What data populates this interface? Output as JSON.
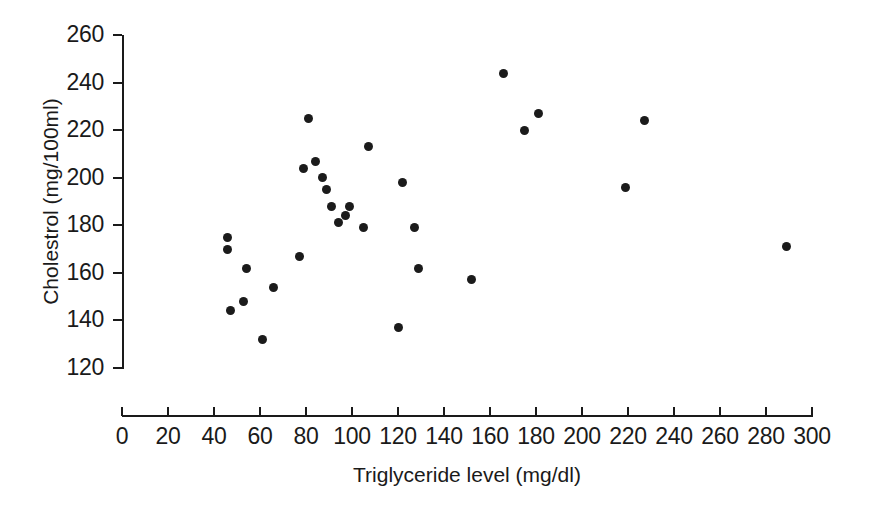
{
  "chart_data": {
    "type": "scatter",
    "title": "",
    "xlabel": "Triglyceride level (mg/dl)",
    "ylabel": "Cholestrol (mg/100ml)",
    "xlim": [
      0,
      300
    ],
    "ylim": [
      120,
      260
    ],
    "xticks": [
      0,
      20,
      40,
      60,
      80,
      100,
      120,
      140,
      160,
      180,
      200,
      220,
      240,
      260,
      280,
      300
    ],
    "yticks": [
      120,
      140,
      160,
      180,
      200,
      220,
      240,
      260
    ],
    "grid": false,
    "legend": null,
    "marker": {
      "shape": "circle",
      "color": "#1b1b1b",
      "size": 9
    },
    "points": [
      {
        "x": 46,
        "y": 175
      },
      {
        "x": 46,
        "y": 170
      },
      {
        "x": 47,
        "y": 144
      },
      {
        "x": 53,
        "y": 148
      },
      {
        "x": 54,
        "y": 162
      },
      {
        "x": 61,
        "y": 132
      },
      {
        "x": 66,
        "y": 154
      },
      {
        "x": 77,
        "y": 167
      },
      {
        "x": 79,
        "y": 204
      },
      {
        "x": 81,
        "y": 225
      },
      {
        "x": 84,
        "y": 207
      },
      {
        "x": 87,
        "y": 200
      },
      {
        "x": 89,
        "y": 195
      },
      {
        "x": 91,
        "y": 188
      },
      {
        "x": 94,
        "y": 181
      },
      {
        "x": 97,
        "y": 184
      },
      {
        "x": 99,
        "y": 188
      },
      {
        "x": 105,
        "y": 179
      },
      {
        "x": 107,
        "y": 213
      },
      {
        "x": 122,
        "y": 198
      },
      {
        "x": 120,
        "y": 137
      },
      {
        "x": 127,
        "y": 179
      },
      {
        "x": 129,
        "y": 162
      },
      {
        "x": 152,
        "y": 157
      },
      {
        "x": 166,
        "y": 244
      },
      {
        "x": 175,
        "y": 220
      },
      {
        "x": 181,
        "y": 227
      },
      {
        "x": 219,
        "y": 196
      },
      {
        "x": 227,
        "y": 224
      },
      {
        "x": 289,
        "y": 171
      }
    ]
  }
}
